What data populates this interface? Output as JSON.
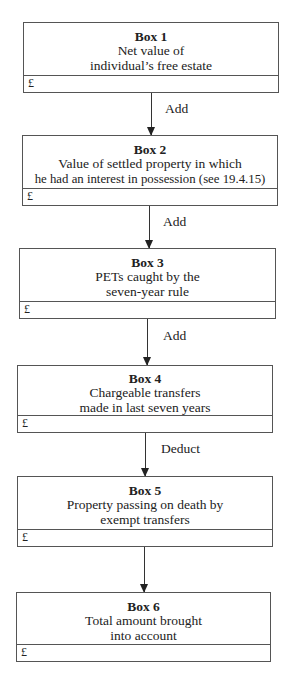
{
  "diagram": {
    "boxes": [
      {
        "title": "Box 1",
        "lines": [
          "Net value of",
          "individual’s free estate"
        ],
        "amount": "£"
      },
      {
        "title": "Box 2",
        "lines": [
          "Value of settled property in which",
          "he had an interest in possession (see 19.4.15)"
        ],
        "amount": "£"
      },
      {
        "title": "Box 3",
        "lines": [
          "PETs caught by the",
          "seven-year rule"
        ],
        "amount": "£"
      },
      {
        "title": "Box 4",
        "lines": [
          "Chargeable transfers",
          "made in last seven years"
        ],
        "amount": "£"
      },
      {
        "title": "Box 5",
        "lines": [
          "Property passing on death by",
          "exempt transfers"
        ],
        "amount": "£"
      },
      {
        "title": "Box 6",
        "lines": [
          "Total amount brought",
          "into account"
        ],
        "amount": "£"
      }
    ],
    "operations": [
      "Add",
      "Add",
      "Add",
      "Deduct",
      ""
    ]
  }
}
